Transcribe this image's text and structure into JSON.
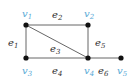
{
  "graph": {
    "colors": {
      "vertex_label": "#5aa9d6",
      "edge_label": "#333333",
      "edge": "#555555",
      "node": "#111111"
    },
    "vertices": [
      {
        "id": "v1",
        "base": "v",
        "sub": "1",
        "x": 26,
        "y": 25,
        "lx": 22,
        "ly": 17
      },
      {
        "id": "v2",
        "base": "v",
        "sub": "2",
        "x": 88,
        "y": 25,
        "lx": 84,
        "ly": 17
      },
      {
        "id": "v3",
        "base": "v",
        "sub": "3",
        "x": 26,
        "y": 58,
        "lx": 22,
        "ly": 74
      },
      {
        "id": "v4",
        "base": "v",
        "sub": "4",
        "x": 88,
        "y": 58,
        "lx": 84,
        "ly": 74
      },
      {
        "id": "v5",
        "base": "v",
        "sub": "5",
        "x": 121,
        "y": 58,
        "lx": 117,
        "ly": 74
      }
    ],
    "edges": [
      {
        "id": "e1",
        "base": "e",
        "sub": "1",
        "from": "v1",
        "to": "v3",
        "lx": 8,
        "ly": 46
      },
      {
        "id": "e2",
        "base": "e",
        "sub": "2",
        "from": "v1",
        "to": "v2",
        "lx": 52,
        "ly": 18
      },
      {
        "id": "e3",
        "base": "e",
        "sub": "3",
        "from": "v1",
        "to": "v4",
        "lx": 50,
        "ly": 52
      },
      {
        "id": "e4",
        "base": "e",
        "sub": "4",
        "from": "v3",
        "to": "v4",
        "lx": 52,
        "ly": 74
      },
      {
        "id": "e5",
        "base": "e",
        "sub": "5",
        "from": "v2",
        "to": "v4",
        "lx": 95,
        "ly": 46
      },
      {
        "id": "e6",
        "base": "e",
        "sub": "6",
        "from": "v4",
        "to": "v5",
        "lx": 98,
        "ly": 74
      }
    ]
  }
}
